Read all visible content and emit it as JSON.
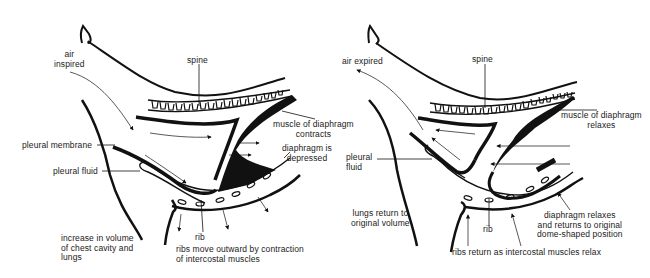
{
  "diagrams": [
    {
      "id": "inspiration",
      "labels": {
        "air": "air\ninspired",
        "spine": "spine",
        "muscle": "muscle of diaphragm\ncontracts",
        "diaphragm": "diaphragm is\ndepressed",
        "pleural_membrane": "pleural membrane",
        "pleural_fluid": "pleural fluid",
        "rib": "rib",
        "volume": "increase in volume\nof chest cavity and\nlungs",
        "ribs": "ribs move outward by contraction\nof intercostal muscles"
      }
    },
    {
      "id": "expiration",
      "labels": {
        "air": "air expired",
        "spine": "spine",
        "muscle": "muscle of diaphragm\nrelaxes",
        "pleural_fluid": "pleural\nfluid",
        "rib": "rib",
        "volume": "lungs return to\noriginal volume",
        "diaphragm": "diaphragm relaxes\nand returns to original\ndome-shaped position",
        "ribs": "ribs return as intercostal muscles relax"
      }
    }
  ],
  "colors": {
    "ink": "#111111",
    "background": "#ffffff"
  }
}
